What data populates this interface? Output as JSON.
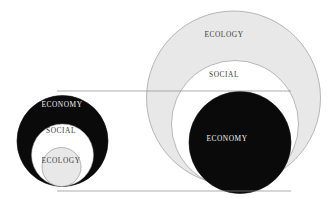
{
  "figure": {
    "background_color": "#ffffff",
    "palette": {
      "black": "#0a0a0a",
      "white": "#ffffff",
      "light_gray": "#e8e8e8",
      "stroke_gray": "#8c8c8c",
      "connector_gray": "#8a8a8a",
      "label_dark": "#3a3a3a",
      "label_light": "#f2f2f2"
    },
    "connectors": [
      {
        "name": "upper-connector",
        "x1": 57,
        "y1": 91,
        "x2": 291,
        "y2": 91
      },
      {
        "name": "lower-connector",
        "x1": 57,
        "y1": 191,
        "x2": 291,
        "y2": 191
      }
    ],
    "diagrams": [
      {
        "id": "left",
        "name": "economy-dominant-model",
        "rings": [
          {
            "label": "ECONOMY",
            "level": "outer",
            "fill": "#0a0a0a",
            "label_color": "#f2f2f2",
            "cx": 62.5,
            "cy": 141,
            "r": 45.5,
            "label_x": 62,
            "label_y": 105
          },
          {
            "label": "SOCIAL",
            "level": "middle",
            "fill": "#ffffff",
            "label_color": "#3a3a3a",
            "cx": 62.5,
            "cy": 155,
            "r": 31,
            "label_x": 61,
            "label_y": 131
          },
          {
            "label": "ECOLOGY",
            "level": "inner",
            "fill": "#e8e8e8",
            "label_color": "#3a3a3a",
            "cx": 61.5,
            "cy": 167,
            "r": 19.5,
            "label_x": 61,
            "label_y": 161
          }
        ]
      },
      {
        "id": "right",
        "name": "ecology-dominant-model",
        "rings": [
          {
            "label": "ECOLOGY",
            "level": "outer",
            "fill": "#e8e8e8",
            "label_color": "#3a3a3a",
            "cx": 233.5,
            "cy": 98,
            "r": 87,
            "label_x": 224,
            "label_y": 35
          },
          {
            "label": "SOCIAL",
            "level": "middle",
            "fill": "#ffffff",
            "label_color": "#3a3a3a",
            "cx": 235,
            "cy": 124,
            "r": 63.5,
            "label_x": 224,
            "label_y": 75
          },
          {
            "label": "ECONOMY",
            "level": "inner",
            "fill": "#0a0a0a",
            "label_color": "#f2f2f2",
            "cx": 240,
            "cy": 142.5,
            "r": 51,
            "label_x": 227,
            "label_y": 139
          }
        ]
      }
    ]
  }
}
